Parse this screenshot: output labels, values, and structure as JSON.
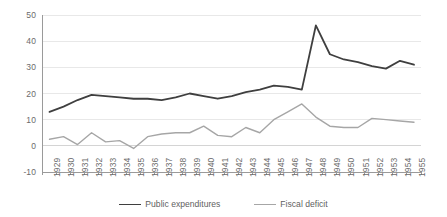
{
  "chart_data": {
    "type": "line",
    "title": "",
    "subtitle": "",
    "xlabel": "",
    "ylabel": "",
    "grid": true,
    "legend_position": "bottom",
    "ylim": [
      -10,
      50
    ],
    "yticks": [
      50,
      40,
      30,
      20,
      10,
      0,
      -10
    ],
    "ytick_labels": [
      "50",
      "40",
      "30",
      "20",
      "10",
      "0",
      "-10"
    ],
    "categories": [
      "1929",
      "1930",
      "1931",
      "1932",
      "1933",
      "1934",
      "1935",
      "1936",
      "1937",
      "1938",
      "1939",
      "1940",
      "1941",
      "1942",
      "1943",
      "1944",
      "1945",
      "1946",
      "1947",
      "1948",
      "1949",
      "1950",
      "1951",
      "1952",
      "1953",
      "1954",
      "1955"
    ],
    "series": [
      {
        "name": "Public expenditures",
        "color": "#3f3f3f",
        "values": [
          13,
          15,
          17.5,
          19.5,
          19,
          18.5,
          18,
          18,
          17.5,
          18.5,
          20,
          19,
          18,
          19,
          20.5,
          21.5,
          23,
          22.5,
          21.5,
          46,
          35,
          33,
          32,
          30.5,
          29.5,
          32.5,
          31
        ]
      },
      {
        "name": "Fiscal deficit",
        "color": "#a6a6a6",
        "values": [
          2.5,
          3.5,
          0.5,
          5,
          1.5,
          2,
          -1,
          3.5,
          4.5,
          5,
          5,
          7.5,
          4,
          3.5,
          7,
          5,
          10,
          13,
          16,
          11,
          7.5,
          7,
          7,
          10.5,
          10,
          9.5,
          9
        ]
      }
    ]
  },
  "legend": {
    "items": [
      {
        "label": "Public expenditures",
        "color": "#3f3f3f"
      },
      {
        "label": "Fiscal deficit",
        "color": "#a6a6a6"
      }
    ]
  },
  "colors": {
    "background": "#ffffff",
    "gridline": "#e8e8e8",
    "axis": "#9a9a9a",
    "zero_line": "#d4d4d4",
    "tick_text": "#6b6b6b",
    "legend_text": "#5f5f5f",
    "public_expenditures": "#3f3f3f",
    "fiscal_deficit": "#a6a6a6"
  }
}
